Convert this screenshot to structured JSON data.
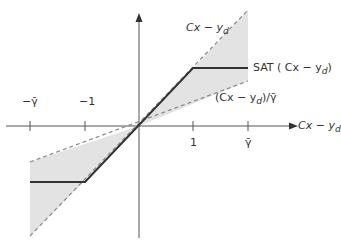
{
  "diagram": {
    "axis_x_label": "Cx − y",
    "axis_x_sub": "d",
    "ticks": [
      {
        "label": "−γ̄",
        "value": "-gamma_bar"
      },
      {
        "label": "−1",
        "value": "-1"
      },
      {
        "label": "1",
        "value": "1"
      },
      {
        "label": "γ̄",
        "value": "gamma_bar"
      }
    ],
    "line_upper_label": "Cx − y",
    "line_upper_sub": "d",
    "sat_label_prefix": "SAT ( Cx − y",
    "sat_label_sub": "d",
    "sat_label_suffix": ")",
    "line_lower_label": "(Cx − y",
    "line_lower_sub": "d",
    "line_lower_suffix": ")/γ̄",
    "colors": {
      "shade": "#e3e3e3",
      "sat": "#333333",
      "dash": "#888888",
      "axis": "#555555"
    }
  }
}
